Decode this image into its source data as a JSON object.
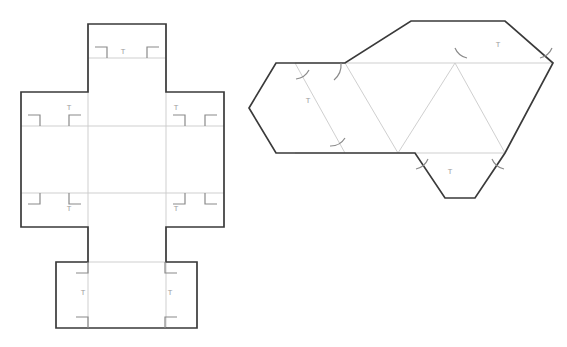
{
  "canvas": {
    "width": 567,
    "height": 347,
    "background": "#ffffff"
  },
  "colors": {
    "cut_line": "#3a3a3a",
    "fold_line": "#c9c9c9",
    "mark_line": "#8a8a8a",
    "glyph_text": "#9b9b9b",
    "paper": "#ffffff"
  },
  "figures": [
    {
      "id": "cuboid-net",
      "name": "Cuboid net with glue flaps",
      "type": "polyhedron-net",
      "shape": "cross",
      "glyph_marks": [
        {
          "label": "T",
          "x": 69,
          "y": 108
        },
        {
          "label": "T",
          "x": 123,
          "y": 52
        },
        {
          "label": "T",
          "x": 176,
          "y": 108
        },
        {
          "label": "T",
          "x": 69,
          "y": 209
        },
        {
          "label": "T",
          "x": 176,
          "y": 209
        },
        {
          "label": "T",
          "x": 83,
          "y": 293
        },
        {
          "label": "T",
          "x": 170,
          "y": 293
        }
      ]
    },
    {
      "id": "tetrahedron-net",
      "name": "Tetrahedron net with glue flaps",
      "type": "polyhedron-net",
      "shape": "triangular-strip",
      "glyph_marks": [
        {
          "label": "T",
          "x": 308,
          "y": 101
        },
        {
          "label": "T",
          "x": 498,
          "y": 45
        },
        {
          "label": "T",
          "x": 450,
          "y": 172
        }
      ]
    }
  ],
  "legend": {
    "t_mark": "T",
    "t_mark_meaning": "tab-mark",
    "corner_bracket_name": "right-angle-corner-bracket",
    "arc_name": "angle-arc-mark"
  }
}
